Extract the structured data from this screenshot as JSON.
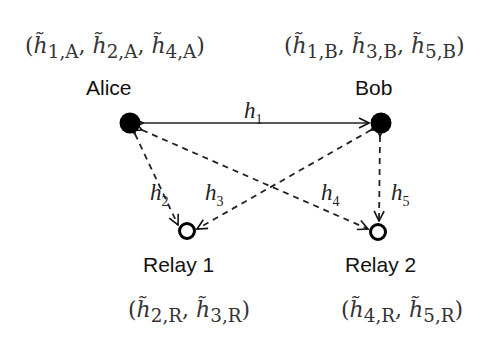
{
  "diagram": {
    "nodes": [
      {
        "id": "alice",
        "label": "Alice",
        "type": "filled",
        "estimates": "(h̃1,A, h̃2,A, h̃4,A)"
      },
      {
        "id": "bob",
        "label": "Bob",
        "type": "filled",
        "estimates": "(h̃1,B, h̃3,B, h̃5,B)"
      },
      {
        "id": "relay1",
        "label": "Relay 1",
        "type": "open",
        "estimates": "(h̃2,R, h̃3,R)"
      },
      {
        "id": "relay2",
        "label": "Relay 2",
        "type": "open",
        "estimates": "(h̃4,R, h̃5,R)"
      }
    ],
    "edges": [
      {
        "label": "h1",
        "from": "alice",
        "to": "bob",
        "style": "solid",
        "bidirectional": true
      },
      {
        "label": "h2",
        "from": "alice",
        "to": "relay1",
        "style": "dashed",
        "bidirectional": true
      },
      {
        "label": "h3",
        "from": "bob",
        "to": "relay1",
        "style": "dashed",
        "bidirectional": true
      },
      {
        "label": "h4",
        "from": "alice",
        "to": "relay2",
        "style": "dashed",
        "bidirectional": true
      },
      {
        "label": "h5",
        "from": "bob",
        "to": "relay2",
        "style": "dashed",
        "bidirectional": true
      }
    ]
  },
  "labels": {
    "alice": "Alice",
    "bob": "Bob",
    "relay1": "Relay 1",
    "relay2": "Relay 2"
  },
  "edge_labels": {
    "h1": {
      "base": "h",
      "sub": "1"
    },
    "h2": {
      "base": "h",
      "sub": "2"
    },
    "h3": {
      "base": "h",
      "sub": "3"
    },
    "h4": {
      "base": "h",
      "sub": "4"
    },
    "h5": {
      "base": "h",
      "sub": "5"
    }
  },
  "estimates": {
    "alice": {
      "open": "(",
      "close": ")",
      "items": [
        {
          "sub": "1,A"
        },
        {
          "sub": "2,A"
        },
        {
          "sub": "4,A"
        }
      ]
    },
    "bob": {
      "open": "(",
      "close": ")",
      "items": [
        {
          "sub": "1,B"
        },
        {
          "sub": "3,B"
        },
        {
          "sub": "5,B"
        }
      ]
    },
    "relay1": {
      "open": "(",
      "close": ")",
      "items": [
        {
          "sub": "2,R"
        },
        {
          "sub": "3,R"
        }
      ]
    },
    "relay2": {
      "open": "(",
      "close": ")",
      "items": [
        {
          "sub": "4,R"
        },
        {
          "sub": "5,R"
        }
      ]
    }
  },
  "symbols": {
    "h_tilde": "h̃",
    "comma": ", "
  }
}
